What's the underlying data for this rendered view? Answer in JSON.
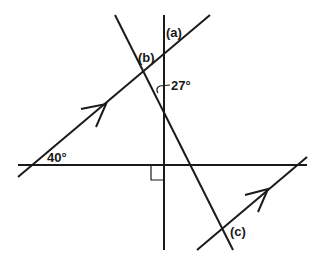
{
  "diagram": {
    "type": "geometry-angles-parallel-lines",
    "labels": {
      "a": "(a)",
      "b": "(b)",
      "c": "(c)",
      "angle_27": "27°",
      "angle_40": "40°"
    },
    "given_angles": [
      {
        "label": "27°",
        "between": [
          "vertical line",
          "transversal"
        ]
      },
      {
        "label": "40°",
        "between": [
          "horizontal line",
          "parallel line 1"
        ]
      }
    ],
    "unknowns": [
      "(a)",
      "(b)",
      "(c)"
    ],
    "right_angle": {
      "between": [
        "horizontal line",
        "vertical line"
      ]
    },
    "parallel_markers": 2,
    "stroke_color": "#1a1a1a"
  }
}
